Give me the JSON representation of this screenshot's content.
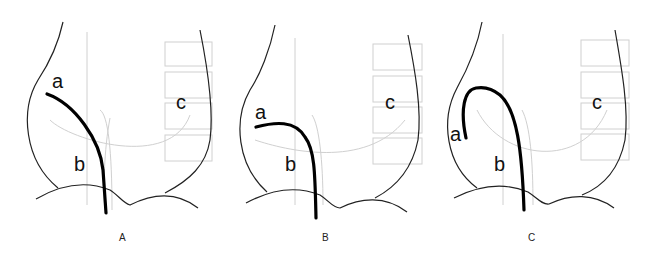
{
  "figure": {
    "panels": [
      {
        "id": "A",
        "caption": "A",
        "labels": {
          "a": "a",
          "b": "b",
          "c": "c"
        }
      },
      {
        "id": "B",
        "caption": "B",
        "labels": {
          "a": "a",
          "b": "b",
          "c": "c"
        }
      },
      {
        "id": "C",
        "caption": "C",
        "labels": {
          "a": "a",
          "b": "b",
          "c": "c"
        }
      }
    ]
  },
  "colors": {
    "outline": "#222222",
    "catheter": "#000000",
    "faint": "#cccccc"
  }
}
